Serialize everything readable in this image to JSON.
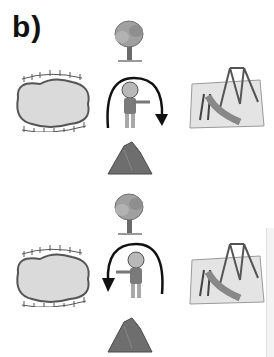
{
  "exercise": {
    "label": "b)"
  },
  "panels": [
    {
      "id": "top",
      "top_item": "tree",
      "left_item": "fenced-pond",
      "center_item": "boy-pointing-right",
      "right_item": "playground-swing-slide",
      "bottom_item": "rock-pile",
      "rotation_direction": "clockwise"
    },
    {
      "id": "bottom",
      "top_item": "tree",
      "left_item": "fenced-pond",
      "center_item": "boy-pointing-left",
      "right_item": "playground-swing-slide",
      "bottom_item": "rock-pile",
      "rotation_direction": "counterclockwise"
    }
  ],
  "colors": {
    "ink": "#111111",
    "tree_leaves": "#9a9a9a",
    "pond": "#d8d8d8",
    "rock": "#6e6e6e",
    "playground_mat": "#e4e4e4"
  }
}
